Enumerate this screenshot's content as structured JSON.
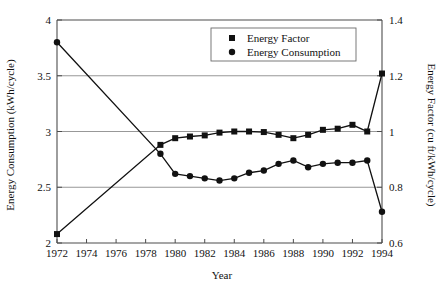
{
  "chart_data": {
    "type": "line",
    "title": "",
    "xlabel": "Year",
    "ylabel": "Energy Consumption (kWh/cycle)",
    "y2label": "Energy Factor (cu ft/kWh/cycle)",
    "grid": true,
    "legend_position": "top-center",
    "xlim": [
      1972,
      1994
    ],
    "ylim": [
      2,
      4
    ],
    "y2lim": [
      0.6,
      1.4
    ],
    "xticks": [
      1972,
      1974,
      1976,
      1978,
      1980,
      1982,
      1984,
      1986,
      1988,
      1990,
      1992,
      1994
    ],
    "xtick_labels": [
      "1972",
      "1974",
      "1976",
      "1978",
      "1980",
      "1982",
      "1984",
      "1986",
      "1988",
      "1990",
      "1992",
      "1994"
    ],
    "yticks": [
      2,
      2.5,
      3,
      3.5,
      4
    ],
    "ytick_labels": [
      "2",
      "2.5",
      "3",
      "3.5",
      "4"
    ],
    "y2ticks": [
      0.6,
      0.8,
      1,
      1.2,
      1.4
    ],
    "y2tick_labels": [
      "0.6",
      "0.8",
      "1",
      "1.2",
      "1.4"
    ],
    "x": [
      1972,
      1979,
      1980,
      1981,
      1982,
      1983,
      1984,
      1985,
      1986,
      1987,
      1988,
      1989,
      1990,
      1991,
      1992,
      1993,
      1994
    ],
    "series": [
      {
        "name": "Energy Factor",
        "axis": "right",
        "marker": "square",
        "values": [
          0.632,
          0.952,
          0.976,
          0.982,
          0.986,
          0.996,
          1.0,
          1.0,
          0.998,
          0.988,
          0.976,
          0.988,
          1.006,
          1.01,
          1.024,
          1.0,
          1.208
        ]
      },
      {
        "name": "Energy Consumption",
        "axis": "left",
        "marker": "circle",
        "values": [
          3.8,
          2.8,
          2.62,
          2.6,
          2.58,
          2.56,
          2.58,
          2.63,
          2.65,
          2.71,
          2.74,
          2.68,
          2.71,
          2.72,
          2.72,
          2.74,
          2.28
        ]
      }
    ]
  },
  "legend": {
    "entries": [
      {
        "label": "Energy Factor",
        "marker": "square"
      },
      {
        "label": "Energy Consumption",
        "marker": "circle"
      }
    ]
  }
}
